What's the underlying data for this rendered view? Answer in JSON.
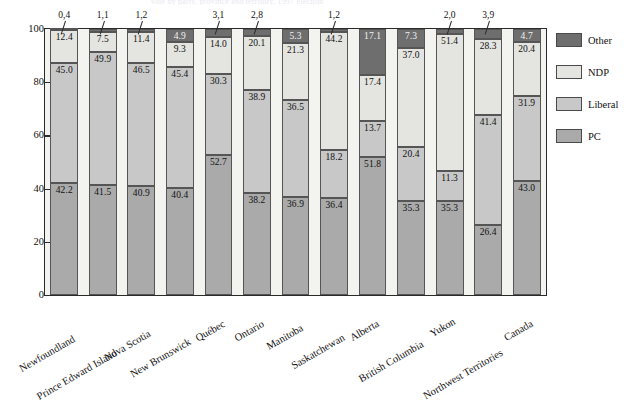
{
  "title_fragment": "Vote by party, province and territory, 1997 election",
  "chart_data": {
    "type": "bar",
    "subtype": "stacked-100-percent",
    "title": "",
    "xlabel": "",
    "ylabel": "",
    "ylim": [
      0,
      100
    ],
    "yticks": [
      0,
      20,
      40,
      60,
      80,
      100
    ],
    "grid": false,
    "legend_position": "right",
    "categories": [
      "Newfoundland",
      "Prince Edward Island",
      "Nova Scotia",
      "New Brunswick",
      "Québec",
      "Ontario",
      "Manitoba",
      "Saskatchewan",
      "Alberta",
      "British Columbia",
      "Yukon",
      "Northwest Territories",
      "Canada"
    ],
    "series": [
      {
        "name": "PC",
        "color": "#aaaaaa",
        "values": [
          42.2,
          41.5,
          40.9,
          40.4,
          52.7,
          38.2,
          36.9,
          36.4,
          51.8,
          35.3,
          35.3,
          26.4,
          43.0
        ]
      },
      {
        "name": "Liberal",
        "color": "#c8c8c8",
        "values": [
          45.0,
          49.9,
          46.5,
          45.4,
          30.3,
          38.9,
          36.5,
          18.2,
          13.7,
          20.4,
          11.3,
          41.4,
          31.9
        ]
      },
      {
        "name": "NDP",
        "color": "#e4e4e0",
        "values": [
          12.4,
          7.5,
          11.4,
          9.3,
          14.0,
          20.1,
          21.3,
          44.2,
          17.4,
          37.0,
          51.4,
          28.3,
          20.4
        ]
      },
      {
        "name": "Other",
        "color": "#6e6e6e",
        "values": [
          0.4,
          1.1,
          1.2,
          4.9,
          3.1,
          2.8,
          5.3,
          1.2,
          17.1,
          7.3,
          2.0,
          3.9,
          4.7
        ]
      }
    ],
    "other_labels_above_bar": [
      {
        "category": "Newfoundland",
        "value": "0,4"
      },
      {
        "category": "Prince Edward Island",
        "value": "1,1"
      },
      {
        "category": "Nova Scotia",
        "value": "1,2"
      },
      {
        "category": "Québec",
        "value": "3,1"
      },
      {
        "category": "Ontario",
        "value": "2,8"
      },
      {
        "category": "Saskatchewan",
        "value": "1,2"
      },
      {
        "category": "Yukon",
        "value": "2,0"
      },
      {
        "category": "Northwest Territories",
        "value": "3,9"
      }
    ]
  },
  "legend": {
    "items": [
      {
        "label": "Other",
        "color": "#6e6e6e"
      },
      {
        "label": "NDP",
        "color": "#e4e4e0"
      },
      {
        "label": "Liberal",
        "color": "#c8c8c8"
      },
      {
        "label": "PC",
        "color": "#aaaaaa"
      }
    ]
  }
}
